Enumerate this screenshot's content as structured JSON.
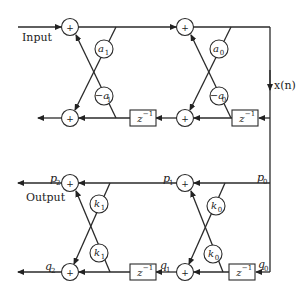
{
  "diagram": {
    "type": "lattice-filter-block-diagram",
    "top_section": {
      "input_label": "Input",
      "signal_label": "x(n)",
      "adder_symbol": "+",
      "coefficients": [
        {
          "id": "a1",
          "text": "a",
          "sub": "1"
        },
        {
          "id": "neg-a1",
          "text": "−a",
          "sub": "1"
        },
        {
          "id": "a0",
          "text": "a",
          "sub": "0"
        },
        {
          "id": "neg-a0",
          "text": "−a",
          "sub": "0"
        }
      ],
      "delays": [
        {
          "id": "z1",
          "text": "z",
          "sup": "−1"
        },
        {
          "id": "z2",
          "text": "z",
          "sup": "−1"
        }
      ]
    },
    "bottom_section": {
      "output_label": "Output",
      "adder_symbol": "+",
      "node_labels": {
        "p2": {
          "text": "p",
          "sub": "2"
        },
        "p1": {
          "text": "p",
          "sub": "1"
        },
        "p0": {
          "text": "p",
          "sub": "0"
        },
        "q2": {
          "text": "q",
          "sub": "2"
        },
        "q1": {
          "text": "q",
          "sub": "1"
        },
        "q0": {
          "text": "q",
          "sub": "0"
        }
      },
      "coefficients": [
        {
          "id": "k1-top",
          "text": "k",
          "sub": "1"
        },
        {
          "id": "k1-bottom",
          "text": "k",
          "sub": "1"
        },
        {
          "id": "k0-top",
          "text": "k",
          "sub": "0"
        },
        {
          "id": "k0-bottom",
          "text": "k",
          "sub": "0"
        }
      ],
      "delays": [
        {
          "id": "z3",
          "text": "z",
          "sup": "−1"
        },
        {
          "id": "z4",
          "text": "z",
          "sup": "−1"
        }
      ]
    }
  }
}
